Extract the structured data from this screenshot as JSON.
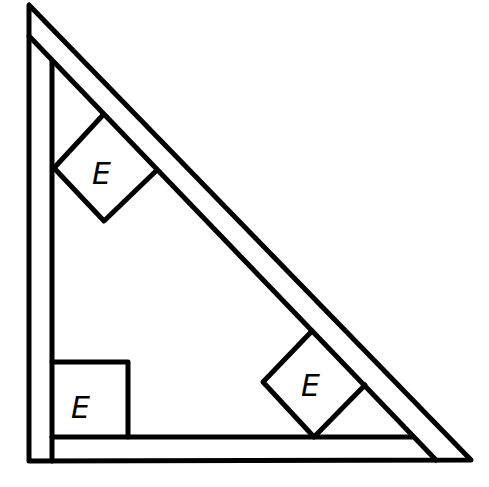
{
  "diagram": {
    "stroke_color": "#000000",
    "background": "#ffffff",
    "boxes": [
      {
        "id": "upper-diamond",
        "label": "E",
        "orientation": "rotated-45"
      },
      {
        "id": "lower-diamond",
        "label": "E",
        "orientation": "rotated-45"
      },
      {
        "id": "corner-square",
        "label": "E",
        "orientation": "axis-aligned"
      }
    ]
  }
}
